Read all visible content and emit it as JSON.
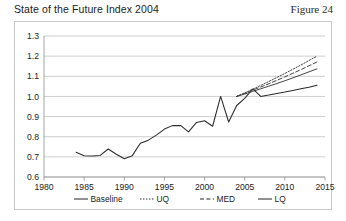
{
  "header": {
    "title": "State of the Future Index 2004",
    "figure_label": "Figure 24"
  },
  "chart_data": {
    "type": "line",
    "title": "State of the Future Index 2004",
    "xlabel": "",
    "ylabel": "",
    "xlim": [
      1980,
      2015
    ],
    "ylim": [
      0.6,
      1.3
    ],
    "xticks": [
      1980,
      1985,
      1990,
      1995,
      2000,
      2005,
      2010,
      2015
    ],
    "yticks": [
      0.6,
      0.7,
      0.8,
      0.9,
      1.0,
      1.1,
      1.2,
      1.3
    ],
    "ytick_labels": [
      "0.6",
      "0.7",
      "0.8",
      "0.9",
      "1.0",
      "1.1",
      "1.2",
      "1.3"
    ],
    "xtick_labels": [
      "1980",
      "1985",
      "1990",
      "1995",
      "2000",
      "2005",
      "2010",
      "2015"
    ],
    "grid": "horizontal",
    "legend_position": "bottom",
    "series": [
      {
        "name": "Baseline",
        "style": "solid",
        "color": "#2b2b2b",
        "x": [
          1984,
          1985,
          1986,
          1987,
          1988,
          1989,
          1990,
          1991,
          1992,
          1993,
          1994,
          1995,
          1996,
          1997,
          1998,
          1999,
          2000,
          2001,
          2002,
          2003,
          2004,
          2005,
          2006,
          2007,
          2008,
          2009,
          2010,
          2011,
          2012,
          2013,
          2014
        ],
        "values": [
          0.723,
          0.706,
          0.704,
          0.707,
          0.739,
          0.713,
          0.691,
          0.706,
          0.768,
          0.783,
          0.808,
          0.838,
          0.855,
          0.856,
          0.824,
          0.871,
          0.879,
          0.852,
          1.0,
          0.873,
          0.955,
          0.99,
          1.037,
          1.0,
          1.007,
          1.015,
          1.022,
          1.03,
          1.038,
          1.046,
          1.055
        ]
      },
      {
        "name": "UQ",
        "style": "dotted",
        "color": "#3a3a3a",
        "x": [
          2004,
          2005,
          2006,
          2007,
          2008,
          2009,
          2010,
          2011,
          2012,
          2013,
          2014
        ],
        "values": [
          1.0,
          1.018,
          1.036,
          1.055,
          1.074,
          1.094,
          1.114,
          1.135,
          1.156,
          1.178,
          1.2
        ]
      },
      {
        "name": "MED",
        "style": "dashed",
        "color": "#3a3a3a",
        "x": [
          2004,
          2005,
          2006,
          2007,
          2008,
          2009,
          2010,
          2011,
          2012,
          2013,
          2014
        ],
        "values": [
          1.0,
          1.015,
          1.031,
          1.047,
          1.063,
          1.08,
          1.097,
          1.115,
          1.133,
          1.152,
          1.171
        ]
      },
      {
        "name": "LQ",
        "style": "solid",
        "color": "#3a3a3a",
        "x": [
          2004,
          2005,
          2006,
          2007,
          2008,
          2009,
          2010,
          2011,
          2012,
          2013,
          2014
        ],
        "values": [
          1.0,
          1.012,
          1.025,
          1.038,
          1.051,
          1.064,
          1.078,
          1.092,
          1.107,
          1.122,
          1.137
        ]
      }
    ],
    "legend": [
      {
        "label": "Baseline",
        "style": "solid"
      },
      {
        "label": "UQ",
        "style": "dotted"
      },
      {
        "label": "MED",
        "style": "dashed"
      },
      {
        "label": "LQ",
        "style": "solid"
      }
    ]
  },
  "colors": {
    "grid": "#c2c2c2",
    "axis": "#9a9a9a",
    "frame": "#c9c9c9",
    "line": "#2b2b2b",
    "text": "#1c1c1c"
  }
}
